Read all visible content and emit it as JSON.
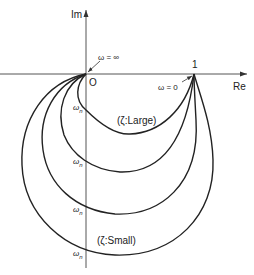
{
  "diagram": {
    "axes": {
      "imag_label": "Im",
      "real_label": "Re",
      "origin_label": "O",
      "unit_label": "1"
    },
    "annotations": {
      "omega_infinity": "ω = ∞",
      "omega_zero": "ω = 0",
      "zeta_large": "(ζ:Large)",
      "zeta_small": "(ζ:Small)",
      "omega_n_symbol": "ω",
      "omega_n_subscript": "n"
    },
    "curves": [
      {
        "name": "zeta-largest",
        "omega_n_crossing_y": 110
      },
      {
        "name": "zeta-large",
        "omega_n_crossing_y": 164
      },
      {
        "name": "zeta-small",
        "omega_n_crossing_y": 210
      },
      {
        "name": "zeta-smallest",
        "omega_n_crossing_y": 251
      }
    ],
    "colors": {
      "line": "#222222",
      "axis": "#555555",
      "background": "#ffffff"
    }
  }
}
